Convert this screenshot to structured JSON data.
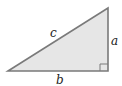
{
  "diagram": {
    "type": "right-triangle",
    "vertices": {
      "left": [
        8,
        71
      ],
      "top_right": [
        108,
        8
      ],
      "bottom_right": [
        108,
        71
      ]
    },
    "right_angle_at": "bottom_right",
    "labels": {
      "hypotenuse": "c",
      "vertical_leg": "a",
      "horizontal_leg": "b"
    },
    "colors": {
      "fill": "#e6e6e6",
      "stroke": "#7a7a7a",
      "text": "#222222"
    }
  }
}
